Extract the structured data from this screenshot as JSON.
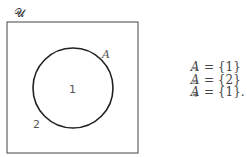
{
  "diagram": {
    "universe_label": "𝒰",
    "set_label": "A",
    "inside_element": "1",
    "outside_element": "2",
    "colors": {
      "stroke": "#222222",
      "text": "#444444"
    }
  },
  "equations": [
    {
      "symbol": "A",
      "mark": "~",
      "rhs": "= {1}"
    },
    {
      "symbol": "A",
      "mark": "≈",
      "rhs": "= {2}"
    },
    {
      "symbol": "A",
      "mark": "≋",
      "rhs": "= {1}."
    }
  ]
}
